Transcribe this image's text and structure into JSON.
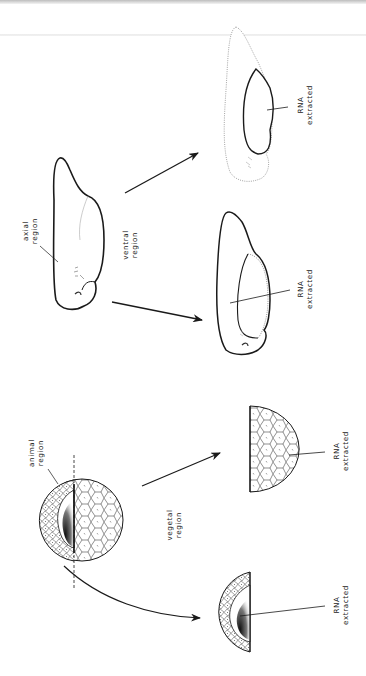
{
  "diagram": {
    "orientation": "rotated-90-ccw",
    "stages": {
      "embryo": {
        "source_label": [
          "axial",
          "region"
        ],
        "cut_label": [
          "ventral",
          "region"
        ],
        "products": [
          {
            "id": "axial-fragment",
            "label": [
              "RNA",
              "extracted"
            ]
          },
          {
            "id": "ventral-fragment",
            "label": [
              "RNA",
              "extracted"
            ]
          }
        ]
      },
      "blastula": {
        "source_label": [
          "animal",
          "region"
        ],
        "cut_label": [
          "vegetal",
          "region"
        ],
        "products": [
          {
            "id": "vegetal-half",
            "label": [
              "RNA",
              "extracted"
            ]
          },
          {
            "id": "animal-half",
            "label": [
              "RNA",
              "extracted"
            ]
          }
        ]
      }
    },
    "colors": {
      "ink": "#1a1a1a",
      "dotted_outline": "#8a8a8a",
      "shading": "#333333"
    }
  }
}
